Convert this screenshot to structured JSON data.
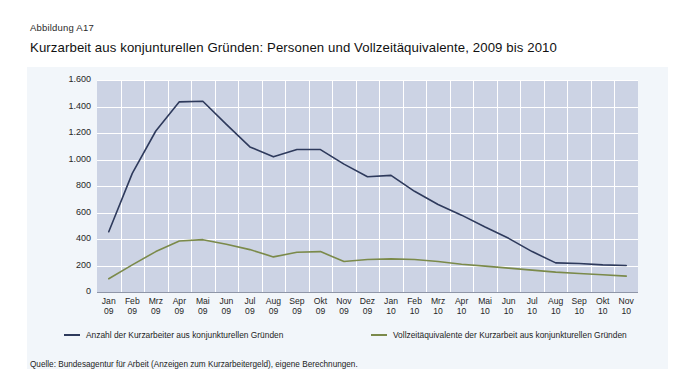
{
  "figure": {
    "label": "Abbildung A17",
    "title": "Kurzarbeit aus konjunturellen Gründen: Personen und Vollzeitäquivalente, 2009 bis 2010",
    "source": "Quelle: Bundesagentur für Arbeit (Anzeigen zum Kurzarbeitergeld), eigene Berechnungen."
  },
  "colors": {
    "series_blue": "#2e3a5c",
    "series_green": "#7b8a4a",
    "plot_background": "#ccd3e4",
    "panel_background": "#f2f6fa",
    "grid": "#ffffff"
  },
  "chart_data": {
    "type": "line",
    "title": "Kurzarbeit aus konjunturellen Gründen: Personen und Vollzeitäquivalente, 2009 bis 2010",
    "xlabel": "",
    "ylabel": "Personen in 1.000",
    "ylim": [
      0,
      1600
    ],
    "yticks": [
      0,
      200,
      400,
      600,
      800,
      1000,
      1200,
      1400,
      1600
    ],
    "ytick_labels": [
      "0",
      "200",
      "400",
      "600",
      "800",
      "1.000",
      "1.200",
      "1.400",
      "1.600"
    ],
    "grid": true,
    "legend_position": "bottom",
    "categories": [
      "Jan 09",
      "Feb 09",
      "Mrz 09",
      "Apr 09",
      "Mai 09",
      "Jun 09",
      "Jul 09",
      "Aug 09",
      "Sep 09",
      "Okt 09",
      "Nov 09",
      "Dez 09",
      "Jan 10",
      "Feb 10",
      "Mrz 10",
      "Apr 10",
      "Mai 10",
      "Jun 10",
      "Jul 10",
      "Aug 10",
      "Sep 10",
      "Okt 10",
      "Nov 10"
    ],
    "x_months": [
      "Jan",
      "Feb",
      "Mrz",
      "Apr",
      "Mai",
      "Jun",
      "Jul",
      "Aug",
      "Sep",
      "Okt",
      "Nov",
      "Dez",
      "Jan",
      "Feb",
      "Mrz",
      "Apr",
      "Mai",
      "Jun",
      "Jul",
      "Aug",
      "Sep",
      "Okt",
      "Nov"
    ],
    "x_years": [
      "09",
      "09",
      "09",
      "09",
      "09",
      "09",
      "09",
      "09",
      "09",
      "09",
      "09",
      "09",
      "10",
      "10",
      "10",
      "10",
      "10",
      "10",
      "10",
      "10",
      "10",
      "10",
      "10"
    ],
    "series": [
      {
        "name": "Anzahl der Kurzarbeiter aus konjunkturellen Gründen",
        "color": "#2e3a5c",
        "values": [
          455,
          895,
          1215,
          1435,
          1440,
          1265,
          1095,
          1020,
          1075,
          1075,
          965,
          870,
          880,
          760,
          660,
          580,
          490,
          405,
          305,
          220,
          215,
          205,
          200
        ]
      },
      {
        "name": "Vollzeitäquivalente der Kurzarbeit aus konjunkturellen Gründen",
        "color": "#7b8a4a",
        "values": [
          100,
          205,
          305,
          385,
          395,
          360,
          320,
          265,
          300,
          305,
          230,
          245,
          250,
          245,
          230,
          210,
          195,
          180,
          165,
          150,
          140,
          130,
          120
        ]
      }
    ]
  },
  "legend": {
    "items": [
      {
        "label": "Anzahl der Kurzarbeiter aus konjunkturellen Gründen",
        "color": "#2e3a5c"
      },
      {
        "label": "Vollzeitäquivalente der Kurzarbeit aus konjunkturellen Gründen",
        "color": "#7b8a4a"
      }
    ]
  }
}
